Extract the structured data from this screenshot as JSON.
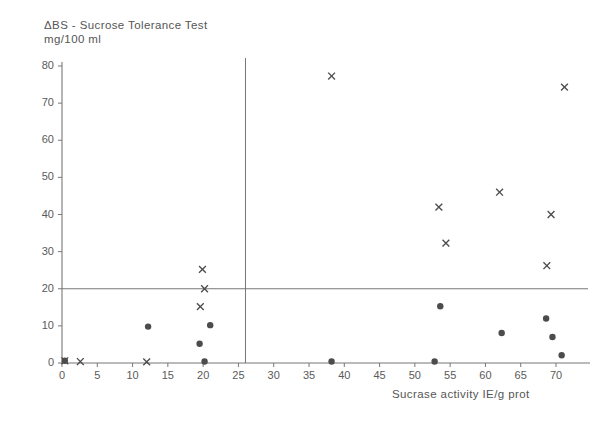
{
  "figure": {
    "title": "ΔBS - Sucrose  Tolerance  Test",
    "subtitle": "mg/100 ml",
    "xlabel": "Sucrase activity  IE/g prot",
    "ylabel": ""
  },
  "chart_data": {
    "type": "scatter",
    "title": "ΔBS - Sucrose Tolerance Test",
    "subtitle": "mg/100 ml",
    "xlabel": "Sucrase activity IE/g prot",
    "ylabel": "ΔBS - Sucrose Tolerance Test mg/100 ml",
    "xlim": [
      0,
      73
    ],
    "ylim": [
      0,
      82
    ],
    "xticks": [
      0,
      5,
      10,
      15,
      20,
      25,
      30,
      35,
      40,
      45,
      50,
      55,
      60,
      65,
      70
    ],
    "yticks": [
      0,
      10,
      20,
      30,
      40,
      50,
      60,
      70,
      80
    ],
    "grid": false,
    "legend": null,
    "reference_lines": [
      {
        "orientation": "horizontal",
        "value": 20,
        "name": "delta-bs-threshold-20"
      },
      {
        "orientation": "vertical",
        "value": 26,
        "name": "sucrase-activity-threshold-26"
      }
    ],
    "series": [
      {
        "name": "cross",
        "marker": "x",
        "points": [
          {
            "x": 0.4,
            "y": 0.6
          },
          {
            "x": 2.6,
            "y": 0.4
          },
          {
            "x": 12.0,
            "y": 0.3
          },
          {
            "x": 19.6,
            "y": 15.2
          },
          {
            "x": 20.2,
            "y": 20.0
          },
          {
            "x": 19.9,
            "y": 25.2
          },
          {
            "x": 38.2,
            "y": 77.3
          },
          {
            "x": 53.4,
            "y": 42.0
          },
          {
            "x": 54.4,
            "y": 32.3
          },
          {
            "x": 62.0,
            "y": 46.0
          },
          {
            "x": 68.7,
            "y": 26.2
          },
          {
            "x": 69.3,
            "y": 40.0
          },
          {
            "x": 71.2,
            "y": 74.3
          }
        ]
      },
      {
        "name": "circle",
        "marker": "o",
        "points": [
          {
            "x": 0.4,
            "y": 0.6
          },
          {
            "x": 12.2,
            "y": 9.8
          },
          {
            "x": 19.5,
            "y": 5.2
          },
          {
            "x": 21.0,
            "y": 10.2
          },
          {
            "x": 20.2,
            "y": 0.4
          },
          {
            "x": 38.2,
            "y": 0.4
          },
          {
            "x": 52.8,
            "y": 0.4
          },
          {
            "x": 53.6,
            "y": 15.3
          },
          {
            "x": 62.3,
            "y": 8.1
          },
          {
            "x": 68.6,
            "y": 12.0
          },
          {
            "x": 69.5,
            "y": 7.0
          },
          {
            "x": 70.8,
            "y": 2.1
          }
        ]
      }
    ]
  },
  "colors": {
    "axis": "#777777",
    "marker": "#4c4c4c",
    "text": "#555555",
    "background": "#ffffff"
  }
}
